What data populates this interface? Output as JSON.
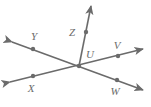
{
  "figure": {
    "width": 151,
    "height": 107,
    "background_color": "#ffffff",
    "stroke_color": "#6b6b6b",
    "label_color": "#6b6b6b",
    "stroke_width": 1.6,
    "dot_radius": 2.2
  },
  "chart_data": {
    "type": "diagram",
    "title": "",
    "subtype": "geometry-line-diagram",
    "vertex": {
      "name": "U",
      "x": 79,
      "y": 66
    },
    "points": [
      {
        "label": "Y",
        "x": 33,
        "y": 49,
        "label_x": 34,
        "label_y": 36
      },
      {
        "label": "X",
        "x": 33,
        "y": 76,
        "label_x": 31,
        "label_y": 88
      },
      {
        "label": "Z",
        "x": 86,
        "y": 32,
        "label_x": 72,
        "label_y": 32
      },
      {
        "label": "U",
        "x": 79,
        "y": 66,
        "label_x": 90,
        "label_y": 54
      },
      {
        "label": "V",
        "x": 118,
        "y": 56,
        "label_x": 117,
        "label_y": 45
      },
      {
        "label": "W",
        "x": 117,
        "y": 80,
        "label_x": 115,
        "label_y": 91
      }
    ],
    "lines": [
      {
        "name": "line-XV",
        "through": [
          "X",
          "U",
          "V"
        ],
        "kind": "double-arrow-line",
        "x1": 10,
        "y1": 82,
        "x2": 143,
        "y2": 49
      },
      {
        "name": "line-YW",
        "through": [
          "Y",
          "U",
          "W"
        ],
        "kind": "double-arrow-line",
        "x1": 12,
        "y1": 42,
        "x2": 143,
        "y2": 90
      },
      {
        "name": "ray-UZ",
        "through": [
          "U",
          "Z"
        ],
        "kind": "single-arrow-ray",
        "x1": 79,
        "y1": 66,
        "x2": 91,
        "y2": 6
      }
    ],
    "labels": [
      "Y",
      "Z",
      "U",
      "V",
      "X",
      "W"
    ]
  }
}
